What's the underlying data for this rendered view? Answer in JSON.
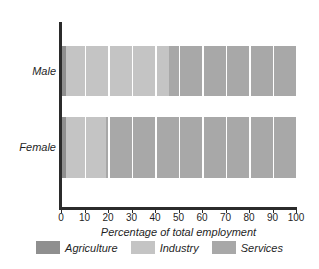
{
  "chart_data": {
    "type": "bar",
    "orientation": "horizontal",
    "stacked": true,
    "normalized": "percent",
    "title": "",
    "xlabel": "Percentage of total employment",
    "ylabel": "",
    "xlim": [
      0,
      100
    ],
    "xticks": [
      0,
      10,
      20,
      30,
      40,
      50,
      60,
      70,
      80,
      90,
      100
    ],
    "xticklabels": [
      "0",
      "10",
      "20",
      "30",
      "40",
      "50",
      "60",
      "70",
      "80",
      "90",
      "100"
    ],
    "grid": "vertical-white-overlay",
    "legend_position": "bottom",
    "categories": [
      "Male",
      "Female"
    ],
    "series": [
      {
        "name": "Agriculture",
        "color": "#8f8f8f",
        "values": [
          2,
          2
        ]
      },
      {
        "name": "Industry",
        "color": "#c4c4c4",
        "values": [
          44,
          17
        ]
      },
      {
        "name": "Services",
        "color": "#a8a8a8",
        "values": [
          54,
          81
        ]
      }
    ],
    "axis_color": "#2b2b2b",
    "background": "#ffffff"
  },
  "axis": {
    "x_title": "Percentage of total employment",
    "tick_labels": [
      "0",
      "10",
      "20",
      "30",
      "40",
      "50",
      "60",
      "70",
      "80",
      "90",
      "100"
    ],
    "category_labels": [
      "Male",
      "Female"
    ]
  },
  "legend": {
    "items": [
      {
        "label": "Agriculture",
        "color": "#8f8f8f"
      },
      {
        "label": "Industry",
        "color": "#c4c4c4"
      },
      {
        "label": "Services",
        "color": "#a8a8a8"
      }
    ]
  }
}
